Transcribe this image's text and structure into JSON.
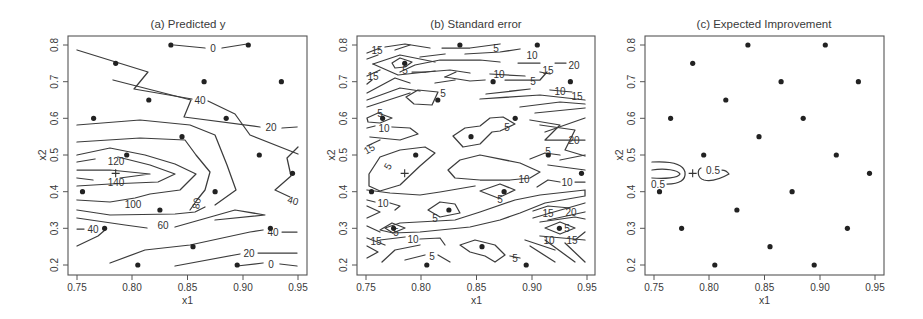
{
  "chart_data": [
    {
      "type": "contour",
      "panel": "a",
      "title": "(a) Predicted y",
      "xlabel": "x1",
      "ylabel": "x2",
      "xlim": [
        0.75,
        0.95
      ],
      "ylim": [
        0.2,
        0.8
      ],
      "xticks": [
        "0.75",
        "0.80",
        "0.85",
        "0.90",
        "0.95"
      ],
      "yticks": [
        "0.2",
        "0.3",
        "0.4",
        "0.5",
        "0.6",
        "0.7",
        "0.8"
      ],
      "contour_levels": [
        "0",
        "20",
        "40",
        "60",
        "80",
        "100",
        "120",
        "140"
      ],
      "contour_labels": [
        {
          "text": "0",
          "x": 0.871,
          "y": 0.795
        },
        {
          "text": "20",
          "x": 0.931,
          "y": 0.672
        },
        {
          "text": "40",
          "x": 0.856,
          "y": 0.677
        },
        {
          "text": "120",
          "x": 0.784,
          "y": 0.48
        },
        {
          "text": "140",
          "x": 0.784,
          "y": 0.423
        },
        {
          "text": "100",
          "x": 0.8,
          "y": 0.37
        },
        {
          "text": "80",
          "x": 0.862,
          "y": 0.37
        },
        {
          "text": "60",
          "x": 0.832,
          "y": 0.3
        },
        {
          "text": "40",
          "x": 0.769,
          "y": 0.3
        },
        {
          "text": "40",
          "x": 0.944,
          "y": 0.39
        },
        {
          "text": "40",
          "x": 0.936,
          "y": 0.3
        },
        {
          "text": "20",
          "x": 0.905,
          "y": 0.235
        },
        {
          "text": "0",
          "x": 0.925,
          "y": 0.205
        }
      ]
    },
    {
      "type": "contour",
      "panel": "b",
      "title": "(b) Standard error",
      "xlabel": "x1",
      "ylabel": "x2",
      "xlim": [
        0.75,
        0.95
      ],
      "ylim": [
        0.2,
        0.8
      ],
      "xticks": [
        "0.75",
        "0.80",
        "0.85",
        "0.90",
        "0.95"
      ],
      "yticks": [
        "0.2",
        "0.3",
        "0.4",
        "0.5",
        "0.6",
        "0.7",
        "0.8"
      ],
      "contour_levels": [
        "5",
        "10",
        "15",
        "20"
      ],
      "contour_labels": [
        {
          "text": "15",
          "x": 0.769,
          "y": 0.785
        },
        {
          "text": "5",
          "x": 0.785,
          "y": 0.735
        },
        {
          "text": "15",
          "x": 0.768,
          "y": 0.715
        },
        {
          "text": "5",
          "x": 0.868,
          "y": 0.795
        },
        {
          "text": "10",
          "x": 0.91,
          "y": 0.78
        },
        {
          "text": "10",
          "x": 0.852,
          "y": 0.72
        },
        {
          "text": "15",
          "x": 0.91,
          "y": 0.72
        },
        {
          "text": "20",
          "x": 0.936,
          "y": 0.74
        },
        {
          "text": "5",
          "x": 0.895,
          "y": 0.7
        },
        {
          "text": "10",
          "x": 0.917,
          "y": 0.675
        },
        {
          "text": "15",
          "x": 0.936,
          "y": 0.66
        },
        {
          "text": "5",
          "x": 0.82,
          "y": 0.67
        },
        {
          "text": "5",
          "x": 0.765,
          "y": 0.612
        },
        {
          "text": "10",
          "x": 0.772,
          "y": 0.575
        },
        {
          "text": "15",
          "x": 0.759,
          "y": 0.522
        },
        {
          "text": "5",
          "x": 0.873,
          "y": 0.575
        },
        {
          "text": "20",
          "x": 0.94,
          "y": 0.548
        },
        {
          "text": "5",
          "x": 0.77,
          "y": 0.468
        },
        {
          "text": "5",
          "x": 0.917,
          "y": 0.515
        },
        {
          "text": "10",
          "x": 0.88,
          "y": 0.42
        },
        {
          "text": "10",
          "x": 0.925,
          "y": 0.41
        },
        {
          "text": "5",
          "x": 0.87,
          "y": 0.375
        },
        {
          "text": "10",
          "x": 0.765,
          "y": 0.365
        },
        {
          "text": "5",
          "x": 0.82,
          "y": 0.33
        },
        {
          "text": "15",
          "x": 0.915,
          "y": 0.34
        },
        {
          "text": "20",
          "x": 0.937,
          "y": 0.345
        },
        {
          "text": "5",
          "x": 0.776,
          "y": 0.29
        },
        {
          "text": "5",
          "x": 0.924,
          "y": 0.31
        },
        {
          "text": "15",
          "x": 0.762,
          "y": 0.268
        },
        {
          "text": "10",
          "x": 0.8,
          "y": 0.272
        },
        {
          "text": "10",
          "x": 0.915,
          "y": 0.272
        },
        {
          "text": "15",
          "x": 0.937,
          "y": 0.272
        },
        {
          "text": "5",
          "x": 0.81,
          "y": 0.222
        },
        {
          "text": "5",
          "x": 0.885,
          "y": 0.225
        }
      ]
    },
    {
      "type": "contour",
      "panel": "c",
      "title": "(c) Expected Improvement",
      "xlabel": "x1",
      "ylabel": "x2",
      "xlim": [
        0.75,
        0.95
      ],
      "ylim": [
        0.2,
        0.8
      ],
      "xticks": [
        "0.75",
        "0.80",
        "0.85",
        "0.90",
        "0.95"
      ],
      "yticks": [
        "0.2",
        "0.3",
        "0.4",
        "0.5",
        "0.6",
        "0.7",
        "0.8"
      ],
      "contour_levels": [
        "0.5"
      ],
      "contour_labels": [
        {
          "text": "0.5",
          "x": 0.762,
          "y": 0.422
        },
        {
          "text": "0.5",
          "x": 0.806,
          "y": 0.462
        }
      ]
    }
  ],
  "design_points": [
    [
      0.835,
      0.8
    ],
    [
      0.905,
      0.8
    ],
    [
      0.785,
      0.75
    ],
    [
      0.865,
      0.7
    ],
    [
      0.935,
      0.7
    ],
    [
      0.815,
      0.65
    ],
    [
      0.765,
      0.6
    ],
    [
      0.885,
      0.6
    ],
    [
      0.845,
      0.55
    ],
    [
      0.795,
      0.5
    ],
    [
      0.915,
      0.5
    ],
    [
      0.945,
      0.45
    ],
    [
      0.755,
      0.4
    ],
    [
      0.875,
      0.4
    ],
    [
      0.825,
      0.35
    ],
    [
      0.775,
      0.3
    ],
    [
      0.925,
      0.3
    ],
    [
      0.855,
      0.25
    ],
    [
      0.805,
      0.2
    ],
    [
      0.895,
      0.2
    ]
  ],
  "optimum_marker": {
    "symbol": "+",
    "x1": 0.785,
    "x2": 0.45
  },
  "panels": {
    "a": {
      "title": "(a) Predicted y",
      "xlabel": "x1",
      "ylabel": "x2"
    },
    "b": {
      "title": "(b) Standard error",
      "xlabel": "x1",
      "ylabel": "x2"
    },
    "c": {
      "title": "(c) Expected Improvement",
      "xlabel": "x1",
      "ylabel": "x2"
    }
  },
  "axes": {
    "xticks": [
      "0.75",
      "0.80",
      "0.85",
      "0.90",
      "0.95"
    ],
    "yticks": [
      "0.2",
      "0.3",
      "0.4",
      "0.5",
      "0.6",
      "0.7",
      "0.8"
    ]
  },
  "labels": {
    "a": [
      "0",
      "20",
      "40",
      "120",
      "140",
      "100",
      "80",
      "60",
      "40",
      "40",
      "40",
      "20",
      "0"
    ],
    "b": [
      "15",
      "5",
      "15",
      "5",
      "10",
      "10",
      "15",
      "20",
      "5",
      "10",
      "15",
      "5",
      "5",
      "10",
      "15",
      "5",
      "20",
      "5",
      "5",
      "10",
      "10",
      "5",
      "10",
      "5",
      "15",
      "20",
      "5",
      "5",
      "15",
      "10",
      "10",
      "15",
      "5",
      "5"
    ],
    "c": [
      "0.5",
      "0.5"
    ]
  }
}
